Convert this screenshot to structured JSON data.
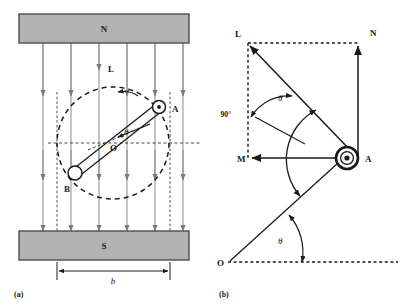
{
  "figure": {
    "title": "",
    "background": "#ffffff",
    "ink": "#1a1a1a",
    "magnet_fill": "#b3b3b3",
    "magnet_stroke": "#4d4d4d",
    "field_line_color": "#8c8c8c"
  },
  "panel_a": {
    "caption": "(a)",
    "magnet_north_label": "N",
    "magnet_south_label": "S",
    "terminal_a_label": "A",
    "terminal_b_label": "B",
    "coil_normal_label": "O",
    "arc_label": "L",
    "angle_label": "θ",
    "width_dimension_label": "b",
    "field_line_count": 6,
    "notes": "Rotating coil between N (top) and S (bottom) pole faces; uniform downward field lines; coil axis at angle theta to the horizontal dashed reference; dashed circle is the path of rotation."
  },
  "panel_b": {
    "caption": "(b)",
    "vector_l_label": "L",
    "vector_n_label": "N",
    "vector_m_label": "M",
    "point_a_label": "A",
    "point_o_label": "O",
    "angle_theta_upper_label": "θ",
    "angle_theta_lower_label": "θ",
    "right_angle_label": "90°",
    "notes": "Vector decomposition at point A: N vertical component, M horizontal component, L resultant; theta between OA line and horizontal dashed baseline, and between AL and AN."
  }
}
